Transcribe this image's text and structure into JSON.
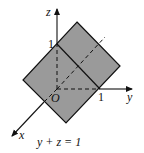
{
  "diagram": {
    "type": "3d-coordinate-plane",
    "axes": {
      "x_label": "x",
      "y_label": "y",
      "z_label": "z",
      "origin_label": "O"
    },
    "ticks": {
      "z_tick": "1",
      "y_tick": "1"
    },
    "caption": "y + z = 1",
    "colors": {
      "plane_fill": "#9a9a9a",
      "line": "#111111",
      "background": "#ffffff"
    }
  }
}
